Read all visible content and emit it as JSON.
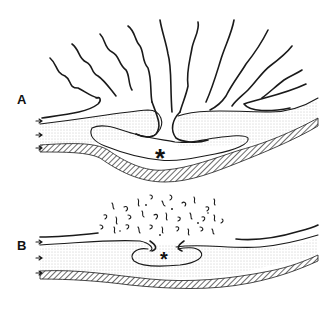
{
  "figure": {
    "panels": [
      {
        "id": "A",
        "label": "A",
        "marker": "*"
      },
      {
        "id": "B",
        "label": "B",
        "marker": "*"
      }
    ]
  },
  "colors": {
    "ink": "#1a1a1a",
    "stipple": "#9a9a9a",
    "background": "#ffffff"
  }
}
